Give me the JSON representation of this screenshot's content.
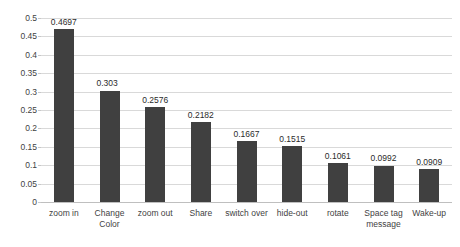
{
  "chart_data": {
    "type": "bar",
    "title": "",
    "subtitle": "",
    "xlabel": "",
    "ylabel": "",
    "ylim": [
      0,
      0.5
    ],
    "yticks": [
      "0",
      "0.05",
      "0.1",
      "0.15",
      "0.2",
      "0.25",
      "0.3",
      "0.35",
      "0.4",
      "0.45",
      "0.5"
    ],
    "ytick_values": [
      0,
      0.05,
      0.1,
      0.15,
      0.2,
      0.25,
      0.3,
      0.35,
      0.4,
      0.45,
      0.5
    ],
    "grid": true,
    "legend": "none",
    "orientation": "vertical",
    "bar_color": "#404040",
    "gridline_color": "#d9d9d9",
    "categories": [
      "zoom in",
      "Change\nColor",
      "zoom out",
      "Share",
      "switch over",
      "hide-out",
      "rotate",
      "Space tag\nmessage",
      "Wake-up"
    ],
    "values": [
      0.4697,
      0.303,
      0.2576,
      0.2182,
      0.1667,
      0.1515,
      0.1061,
      0.0992,
      0.0909
    ],
    "data_labels": [
      "0.4697",
      "0.303",
      "0.2576",
      "0.2182",
      "0.1667",
      "0.1515",
      "0.1061",
      "0.0992",
      "0.0909"
    ]
  }
}
